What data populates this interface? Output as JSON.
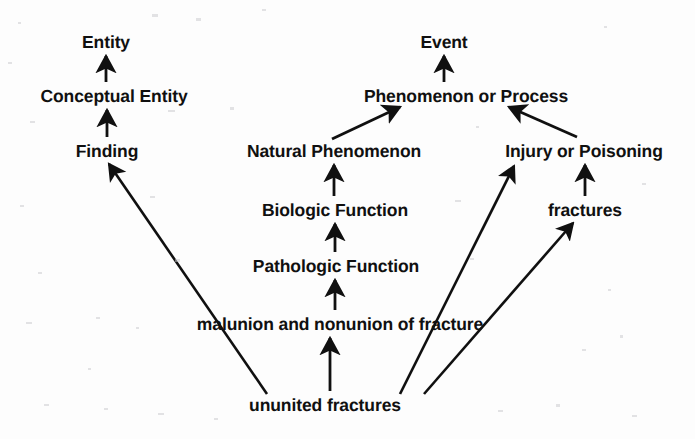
{
  "diagram": {
    "type": "directed-acyclic-graph",
    "background_color": "#fdfdfd",
    "ink_color": "#101010",
    "nodes": [
      {
        "id": "entity",
        "label": "Entity",
        "x": 106,
        "y": 42,
        "size": "md"
      },
      {
        "id": "conceptual",
        "label": "Conceptual Entity",
        "x": 114,
        "y": 96,
        "size": "md"
      },
      {
        "id": "finding",
        "label": "Finding",
        "x": 107,
        "y": 151,
        "size": "md"
      },
      {
        "id": "event",
        "label": "Event",
        "x": 444,
        "y": 42,
        "size": "md"
      },
      {
        "id": "phenomenon",
        "label": "Phenomenon or Process",
        "x": 466,
        "y": 96,
        "size": "md"
      },
      {
        "id": "natphen",
        "label": "Natural Phenomenon",
        "x": 334,
        "y": 151,
        "size": "md"
      },
      {
        "id": "injury",
        "label": "Injury or Poisoning",
        "x": 584,
        "y": 151,
        "size": "md"
      },
      {
        "id": "biologic",
        "label": "Biologic Function",
        "x": 335,
        "y": 210,
        "size": "md"
      },
      {
        "id": "fractures",
        "label": "fractures",
        "x": 585,
        "y": 210,
        "size": "md"
      },
      {
        "id": "pathologic",
        "label": "Pathologic Function",
        "x": 336,
        "y": 266,
        "size": "md"
      },
      {
        "id": "malunion",
        "label": "malunion and nonunion of fracture",
        "x": 340,
        "y": 324,
        "size": "md"
      },
      {
        "id": "ununited",
        "label": "ununited fractures",
        "x": 325,
        "y": 405,
        "size": "md"
      }
    ],
    "edges": [
      {
        "from": "conceptual",
        "to": "entity",
        "x1": 106,
        "y1": 82,
        "x2": 106,
        "y2": 56,
        "kind": "isa-vertical"
      },
      {
        "from": "finding",
        "to": "conceptual",
        "x1": 107,
        "y1": 137,
        "x2": 107,
        "y2": 110,
        "kind": "isa-vertical"
      },
      {
        "from": "phenomenon",
        "to": "event",
        "x1": 444,
        "y1": 82,
        "x2": 444,
        "y2": 56,
        "kind": "isa-vertical"
      },
      {
        "from": "natphen",
        "to": "phenomenon",
        "x1": 332,
        "y1": 139,
        "x2": 400,
        "y2": 107,
        "kind": "isa-diagonal"
      },
      {
        "from": "injury",
        "to": "phenomenon",
        "x1": 577,
        "y1": 137,
        "x2": 509,
        "y2": 107,
        "kind": "isa-diagonal"
      },
      {
        "from": "biologic",
        "to": "natphen",
        "x1": 334,
        "y1": 196,
        "x2": 334,
        "y2": 165,
        "kind": "isa-vertical"
      },
      {
        "from": "fractures",
        "to": "injury",
        "x1": 585,
        "y1": 196,
        "x2": 585,
        "y2": 165,
        "kind": "isa-vertical"
      },
      {
        "from": "pathologic",
        "to": "biologic",
        "x1": 335,
        "y1": 252,
        "x2": 335,
        "y2": 224,
        "kind": "isa-vertical"
      },
      {
        "from": "malunion",
        "to": "pathologic",
        "x1": 335,
        "y1": 310,
        "x2": 335,
        "y2": 280,
        "kind": "isa-vertical"
      },
      {
        "from": "ununited",
        "to": "malunion",
        "x1": 330,
        "y1": 391,
        "x2": 330,
        "y2": 338,
        "kind": "isa-vertical"
      },
      {
        "from": "ununited",
        "to": "finding",
        "x1": 267,
        "y1": 394,
        "x2": 109,
        "y2": 164,
        "kind": "isa-long-diagonal"
      },
      {
        "from": "ununited",
        "to": "injury",
        "x1": 400,
        "y1": 394,
        "x2": 514,
        "y2": 166,
        "kind": "isa-long-diagonal"
      },
      {
        "from": "ununited",
        "to": "fractures",
        "x1": 424,
        "y1": 394,
        "x2": 573,
        "y2": 223,
        "kind": "isa-long-diagonal"
      }
    ]
  }
}
